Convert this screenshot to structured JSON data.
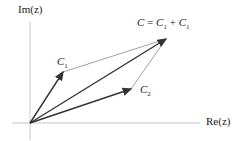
{
  "labels": {
    "imag_axis": "Im(z)",
    "real_axis": "Re(z)",
    "c1": "C",
    "c1_sub": "1",
    "c2": "C",
    "c2_sub": "2",
    "sum_lhs": "C",
    "sum_eq": " = ",
    "sum_t1": "C",
    "sum_t1_sub": "1",
    "sum_plus": " + ",
    "sum_t2": "C",
    "sum_t2_sub": "1"
  },
  "geometry": {
    "origin": [
      30,
      123
    ],
    "c1_tip": [
      63,
      72
    ],
    "c2_tip": [
      131,
      89
    ],
    "sum_tip": [
      166,
      39
    ]
  },
  "colors": {
    "axis": "#c8c8c8",
    "vector": "#333333",
    "parallelogram": "#888888"
  }
}
